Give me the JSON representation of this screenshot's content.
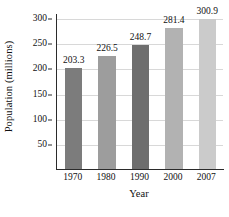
{
  "chart_data": {
    "type": "bar",
    "title": "",
    "xlabel": "Year",
    "ylabel": "Population (millions)",
    "categories": [
      "1970",
      "1980",
      "1990",
      "2000",
      "2007"
    ],
    "values": [
      203.3,
      226.5,
      248.7,
      281.4,
      300.9
    ],
    "value_labels": [
      "203.3",
      "226.5",
      "248.7",
      "281.4",
      "300.9"
    ],
    "bar_colors": [
      "#7c7c7c",
      "#9d9d9d",
      "#6e6e6e",
      "#b2b2b2",
      "#cbcbcb"
    ],
    "ylim": [
      0,
      310
    ],
    "yticks": [
      50,
      100,
      150,
      200,
      250,
      300
    ],
    "ytick_labels": [
      "50",
      "100",
      "150",
      "200",
      "250",
      "300"
    ],
    "grid": true,
    "grid_color": "#d8d8d8",
    "legend": "none",
    "axis_color": "#2b2b2b"
  }
}
